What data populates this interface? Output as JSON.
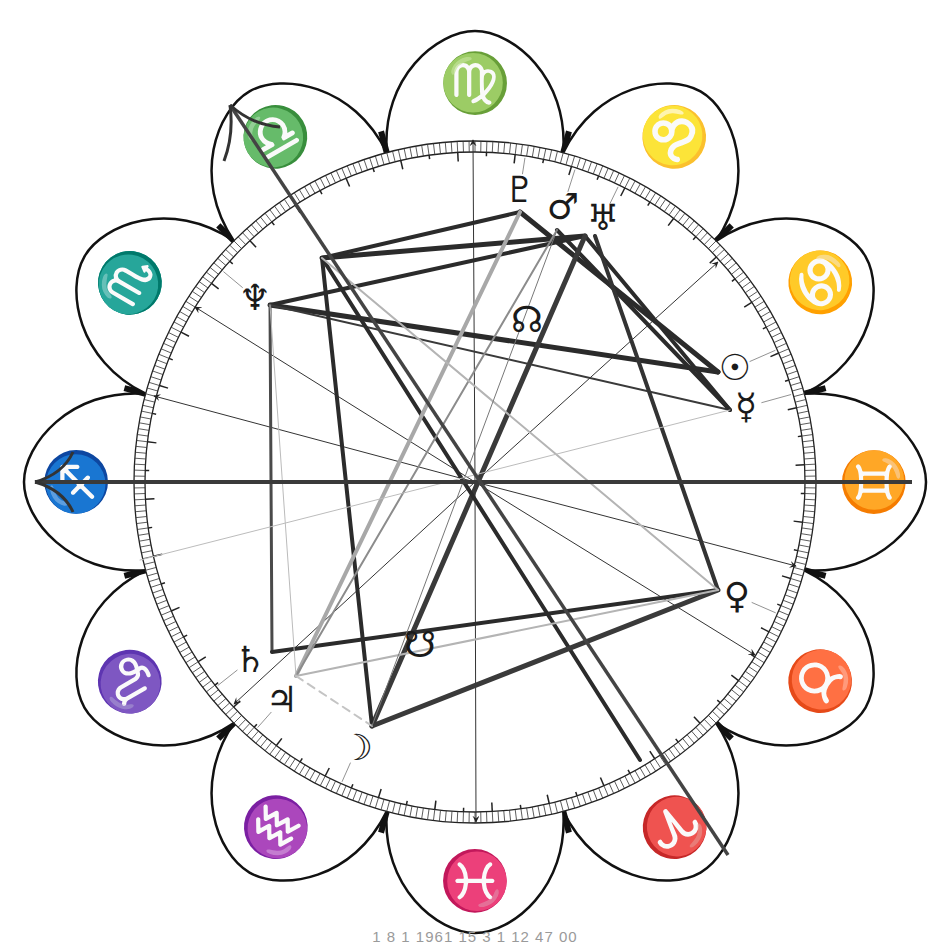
{
  "chart_data": {
    "type": "diagram",
    "center": [
      475,
      482
    ],
    "ring": {
      "inner_r": 330,
      "outer_r": 341
    },
    "signs": [
      {
        "name": "Virgo",
        "glyph": "♍",
        "angle_deg": 90
      },
      {
        "name": "Leo",
        "glyph": "♌",
        "angle_deg": 60
      },
      {
        "name": "Cancer",
        "glyph": "♋",
        "angle_deg": 30
      },
      {
        "name": "Gemini",
        "glyph": "♊",
        "angle_deg": 0
      },
      {
        "name": "Taurus",
        "glyph": "♉",
        "angle_deg": -30
      },
      {
        "name": "Aries",
        "glyph": "♈",
        "angle_deg": -60
      },
      {
        "name": "Pisces",
        "glyph": "♓",
        "angle_deg": -90
      },
      {
        "name": "Aquarius",
        "glyph": "♒",
        "angle_deg": -120
      },
      {
        "name": "Capricorn",
        "glyph": "♑",
        "angle_deg": -150
      },
      {
        "name": "Sagittarius",
        "glyph": "♐",
        "angle_deg": 180
      },
      {
        "name": "Scorpio",
        "glyph": "♏",
        "angle_deg": 150
      },
      {
        "name": "Libra",
        "glyph": "♎",
        "angle_deg": 120
      }
    ],
    "planets": [
      {
        "name": "Pluto",
        "glyph": "♇",
        "x": 520,
        "y": 190,
        "anchor": [
          520,
          212
        ]
      },
      {
        "name": "Mars",
        "glyph": "♂",
        "x": 563,
        "y": 207,
        "anchor": [
          557,
          230
        ]
      },
      {
        "name": "Uranus",
        "glyph": "♅",
        "x": 603,
        "y": 218,
        "anchor": [
          585,
          236
        ]
      },
      {
        "name": "Neptune",
        "glyph": "♆",
        "x": 255,
        "y": 298,
        "anchor": [
          270,
          305
        ]
      },
      {
        "name": "North Node",
        "glyph": "☊",
        "x": 527,
        "y": 320,
        "anchor": null
      },
      {
        "name": "Sun",
        "glyph": "☉",
        "x": 735,
        "y": 368,
        "anchor": [
          718,
          372
        ]
      },
      {
        "name": "Mercury",
        "glyph": "☿",
        "x": 746,
        "y": 407,
        "anchor": [
          730,
          410
        ]
      },
      {
        "name": "Venus",
        "glyph": "♀",
        "x": 737,
        "y": 596,
        "anchor": [
          718,
          590
        ]
      },
      {
        "name": "South Node",
        "glyph": "☋",
        "x": 420,
        "y": 645,
        "anchor": null
      },
      {
        "name": "Saturn",
        "glyph": "♄",
        "x": 250,
        "y": 660,
        "anchor": [
          272,
          652
        ]
      },
      {
        "name": "Jupiter",
        "glyph": "♃",
        "x": 282,
        "y": 700,
        "anchor": [
          296,
          676
        ]
      },
      {
        "name": "Moon",
        "glyph": "☽",
        "x": 357,
        "y": 748,
        "anchor": [
          372,
          726
        ]
      }
    ],
    "aspects": [
      {
        "from": [
          322,
          258
        ],
        "to": [
          585,
          236
        ],
        "color": "#2b2b2b",
        "width": 5
      },
      {
        "from": [
          270,
          305
        ],
        "to": [
          585,
          236
        ],
        "color": "#2b2b2b",
        "width": 4
      },
      {
        "from": [
          270,
          305
        ],
        "to": [
          718,
          372
        ],
        "color": "#2b2b2b",
        "width": 5
      },
      {
        "from": [
          270,
          305
        ],
        "to": [
          730,
          410
        ],
        "color": "#3a3a3a",
        "width": 2
      },
      {
        "from": [
          270,
          305
        ],
        "to": [
          272,
          652
        ],
        "color": "#4a4a4a",
        "width": 3
      },
      {
        "from": [
          520,
          212
        ],
        "to": [
          718,
          372
        ],
        "color": "#2b2b2b",
        "width": 5
      },
      {
        "from": [
          520,
          212
        ],
        "to": [
          322,
          258
        ],
        "color": "#2b2b2b",
        "width": 4
      },
      {
        "from": [
          557,
          230
        ],
        "to": [
          730,
          410
        ],
        "color": "#2b2b2b",
        "width": 4
      },
      {
        "from": [
          585,
          236
        ],
        "to": [
          730,
          410
        ],
        "color": "#2b2b2b",
        "width": 4
      },
      {
        "from": [
          585,
          236
        ],
        "to": [
          372,
          726
        ],
        "color": "#3a3a3a",
        "width": 5
      },
      {
        "from": [
          595,
          236
        ],
        "to": [
          718,
          590
        ],
        "color": "#333333",
        "width": 4
      },
      {
        "from": [
          322,
          258
        ],
        "to": [
          372,
          726
        ],
        "color": "#2b2b2b",
        "width": 4
      },
      {
        "from": [
          322,
          258
        ],
        "to": [
          640,
          760
        ],
        "color": "#2b2b2b",
        "width": 4
      },
      {
        "from": [
          272,
          652
        ],
        "to": [
          718,
          590
        ],
        "color": "#2b2b2b",
        "width": 4
      },
      {
        "from": [
          372,
          726
        ],
        "to": [
          718,
          590
        ],
        "color": "#3a3a3a",
        "width": 5
      },
      {
        "from": [
          520,
          212
        ],
        "to": [
          296,
          676
        ],
        "color": "#a8a8a8",
        "width": 4
      },
      {
        "from": [
          557,
          230
        ],
        "to": [
          296,
          676
        ],
        "color": "#8c8c8c",
        "width": 2
      },
      {
        "from": [
          296,
          676
        ],
        "to": [
          718,
          590
        ],
        "color": "#b4b4b4",
        "width": 2
      },
      {
        "from": [
          322,
          258
        ],
        "to": [
          718,
          590
        ],
        "color": "#b4b4b4",
        "width": 2
      },
      {
        "from": [
          296,
          676
        ],
        "to": [
          372,
          726
        ],
        "color": "#c4c4c4",
        "width": 2,
        "dash": true
      },
      {
        "from": [
          270,
          305
        ],
        "to": [
          296,
          676
        ],
        "color": "#bbbbbb",
        "width": 1
      },
      {
        "from": [
          557,
          230
        ],
        "to": [
          372,
          726
        ],
        "color": "#777777",
        "width": 1
      },
      {
        "from": [
          140,
          560
        ],
        "to": [
          730,
          410
        ],
        "color": "#bcbcbc",
        "width": 1
      }
    ],
    "axes": {
      "asc_dsc": {
        "from": [
          35,
          482
        ],
        "to": [
          912,
          482
        ]
      },
      "mc_ic": {
        "from": [
          230,
          105
        ],
        "to": [
          728,
          855
        ]
      }
    },
    "house_cusps": [
      {
        "from": [
          475,
          482
        ],
        "to": [
          473,
          140
        ]
      },
      {
        "from": [
          475,
          482
        ],
        "to": [
          476,
          822
        ]
      },
      {
        "from": [
          475,
          482
        ],
        "to": [
          718,
          262
        ]
      },
      {
        "from": [
          475,
          482
        ],
        "to": [
          234,
          704
        ]
      },
      {
        "from": [
          475,
          482
        ],
        "to": [
          796,
          566
        ]
      },
      {
        "from": [
          475,
          482
        ],
        "to": [
          154,
          396
        ]
      },
      {
        "from": [
          475,
          482
        ],
        "to": [
          755,
          655
        ]
      },
      {
        "from": [
          475,
          482
        ],
        "to": [
          195,
          307
        ]
      }
    ]
  },
  "footer": {
    "caption": "1  8  1 1961  15  3  1  12 47 00"
  }
}
